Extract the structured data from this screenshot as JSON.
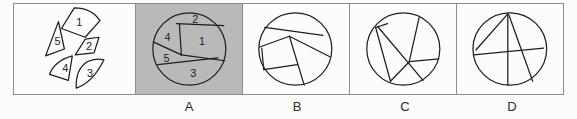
{
  "figure": {
    "kind": "visual-puzzle-assembly",
    "prompt_panel": {
      "name": "scattered-pieces",
      "piece_labels": [
        "1",
        "2",
        "3",
        "4",
        "5"
      ],
      "piece_count": 5
    },
    "options": [
      {
        "key": "A",
        "label": "A",
        "selected": true,
        "highlight_color": "#b9b9b9",
        "shows_piece_numbers": true,
        "piece_labels": [
          "1",
          "2",
          "3",
          "4",
          "5"
        ]
      },
      {
        "key": "B",
        "label": "B",
        "selected": false,
        "highlight_color": "#fcfcfb",
        "shows_piece_numbers": false,
        "piece_labels": []
      },
      {
        "key": "C",
        "label": "C",
        "selected": false,
        "highlight_color": "#fcfcfb",
        "shows_piece_numbers": false,
        "piece_labels": []
      },
      {
        "key": "D",
        "label": "D",
        "selected": false,
        "highlight_color": "#fcfcfb",
        "shows_piece_numbers": false,
        "piece_labels": []
      }
    ],
    "colors": {
      "background": "#fbfbfa",
      "panel_background": "#fcfcfb",
      "selected_panel_background": "#b9b9b9",
      "stroke": "#1d1d1d",
      "border": "#8d8d8d",
      "text": "#2b2b2b"
    }
  }
}
